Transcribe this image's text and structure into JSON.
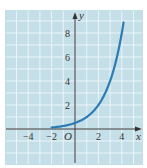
{
  "chart_data": {
    "type": "line",
    "title": "",
    "xlabel": "x",
    "ylabel": "y",
    "origin_label": "O",
    "function": "y = 2^(x-1)",
    "xlim": [
      -6,
      5.8
    ],
    "ylim": [
      -3,
      10
    ],
    "grid": true,
    "x_ticks": [
      -4,
      -2,
      2,
      4
    ],
    "y_ticks": [
      2,
      4,
      6,
      8
    ],
    "series": [
      {
        "name": "curve",
        "x": [
          -2,
          -1,
          0,
          1,
          2,
          3,
          4,
          4.17
        ],
        "y": [
          0.125,
          0.25,
          0.5,
          1,
          2,
          4,
          8,
          9
        ]
      }
    ]
  },
  "colors": {
    "background": "#c5dfe8",
    "grid": "#eef7fa",
    "axis": "#333333",
    "curve": "#2b7bb5"
  }
}
